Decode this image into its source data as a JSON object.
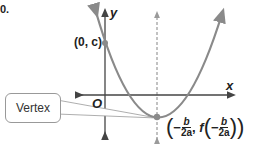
{
  "stub_text": "0.",
  "labels": {
    "y_axis": "y",
    "x_axis": "x",
    "origin": "O",
    "y_intercept": "(0, c)",
    "callout": "Vertex",
    "vertex_minus": "−",
    "vertex_b": "b",
    "vertex_2a": "2a",
    "vertex_f": "f"
  },
  "colors": {
    "curve": "#8a8a8a",
    "axis": "#444444",
    "dashed": "#9a9a9a",
    "point": "#8a8a8a"
  }
}
